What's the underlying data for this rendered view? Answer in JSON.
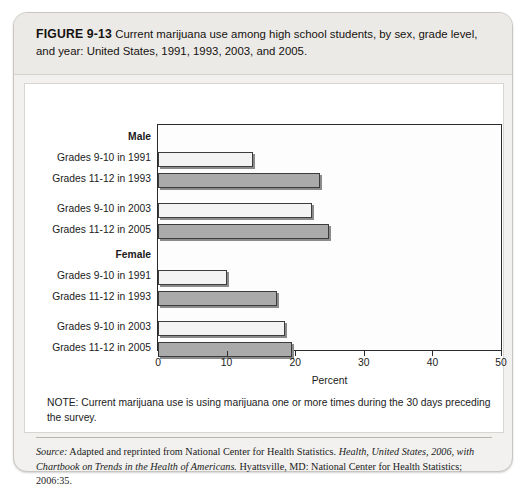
{
  "figure": {
    "label": "FIGURE 9-13",
    "caption": "Current marijuana use among high school students, by sex, grade level, and year: United States, 1991, 1993, 2003, and 2005."
  },
  "note": {
    "text": "NOTE: Current marijuana use is using marijuana one or more times during the 30 days preceding the survey."
  },
  "source": {
    "label": "Source:",
    "part1": " Adapted and reprinted from National Center for Health Statistics. ",
    "italic1": "Health, United States, 2006, with Chartbook on Trends in the Health of Americans.",
    "part2": " Hyattsville, MD: National Center for Health Statistics; 2006:35."
  },
  "chart_data": {
    "type": "bar",
    "orientation": "horizontal",
    "title": "",
    "xlabel": "Percent",
    "ylabel": "",
    "xlim": [
      0,
      50
    ],
    "xticks": [
      0,
      10,
      20,
      30,
      40,
      50
    ],
    "xticklabels": [
      "0",
      "10",
      "20",
      "30",
      "40",
      "50"
    ],
    "grid": false,
    "legend": "none",
    "groups": [
      {
        "name": "Male",
        "rows": [
          {
            "category": "Grades 9-10 in 1991",
            "value": 13.9,
            "shade": "light"
          },
          {
            "category": "Grades 11-12 in 1993",
            "value": 23.6,
            "shade": "dark"
          },
          {
            "category": "Grades 9-10 in 2003",
            "value": 22.4,
            "shade": "light"
          },
          {
            "category": "Grades 11-12 in 2005",
            "value": 24.9,
            "shade": "dark"
          }
        ]
      },
      {
        "name": "Female",
        "rows": [
          {
            "category": "Grades 9-10 in 1991",
            "value": 10.0,
            "shade": "light"
          },
          {
            "category": "Grades 11-12 in 1993",
            "value": 17.4,
            "shade": "dark"
          },
          {
            "category": "Grades 9-10 in 2003",
            "value": 18.5,
            "shade": "light"
          },
          {
            "category": "Grades 11-12 in 2005",
            "value": 19.6,
            "shade": "dark"
          }
        ]
      }
    ],
    "colors": {
      "light_bar": "#f3f3f3",
      "dark_bar": "#aaaaaa",
      "bar_outline": "#3c3c3c",
      "axis": "#2b2b2b"
    }
  }
}
